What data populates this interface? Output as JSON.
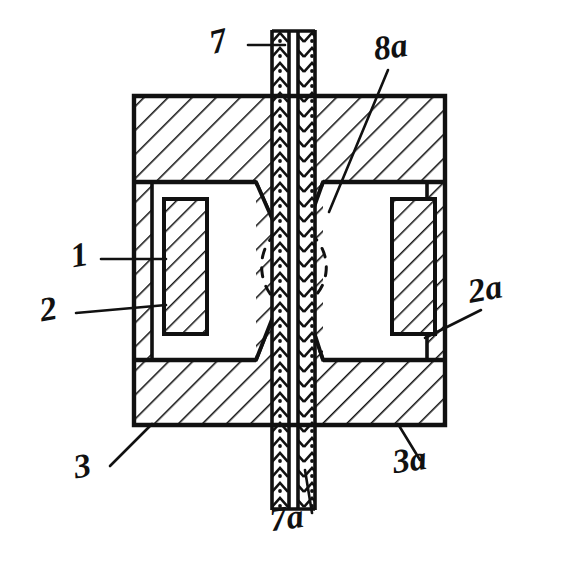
{
  "figure": {
    "style": "line drawing, black ink on white, cross-hatched sections",
    "background_color": "#ffffff",
    "ink_color": "#111111"
  },
  "labels": [
    {
      "id": "label-7",
      "text": "7",
      "x": 221,
      "y": 52,
      "size": 34,
      "rotate": -14,
      "describes": "upper armature shaft / stem"
    },
    {
      "id": "label-8a",
      "text": "8a",
      "x": 392,
      "y": 58,
      "size": 34,
      "rotate": -8,
      "describes": "upper pole face gap region"
    },
    {
      "id": "label-1",
      "text": "1",
      "x": 81,
      "y": 266,
      "size": 34,
      "rotate": -10,
      "describes": "left frame / core leg"
    },
    {
      "id": "label-2",
      "text": "2",
      "x": 50,
      "y": 320,
      "size": 34,
      "rotate": -10,
      "describes": "left coil winding"
    },
    {
      "id": "label-2a",
      "text": "2a",
      "x": 487,
      "y": 300,
      "size": 34,
      "rotate": -10,
      "describes": "right coil winding"
    },
    {
      "id": "label-3",
      "text": "3",
      "x": 84,
      "y": 477,
      "size": 34,
      "rotate": -10,
      "describes": "lower left frame section"
    },
    {
      "id": "label-3a",
      "text": "3a",
      "x": 411,
      "y": 471,
      "size": 34,
      "rotate": -8,
      "describes": "lower right frame section"
    },
    {
      "id": "label-7a",
      "text": "7a",
      "x": 288,
      "y": 529,
      "size": 34,
      "rotate": -8,
      "describes": "lower armature shaft / stem"
    }
  ],
  "leaders": [
    {
      "id": "leader-7",
      "from": [
        248,
        45
      ],
      "to": [
        285,
        45
      ]
    },
    {
      "id": "leader-8a",
      "from": [
        388,
        70
      ],
      "to": [
        329,
        212
      ]
    },
    {
      "id": "leader-1",
      "from": [
        101,
        259
      ],
      "to": [
        166,
        259
      ]
    },
    {
      "id": "leader-2",
      "from": [
        76,
        313
      ],
      "to": [
        166,
        305
      ]
    },
    {
      "id": "leader-2a",
      "from": [
        481,
        310
      ],
      "to": [
        425,
        338
      ]
    },
    {
      "id": "leader-3",
      "from": [
        110,
        466
      ],
      "to": [
        152,
        424
      ]
    },
    {
      "id": "leader-3a",
      "from": [
        420,
        460
      ],
      "to": [
        398,
        424
      ]
    },
    {
      "id": "leader-7a",
      "from": [
        312,
        513
      ],
      "to": [
        305,
        470
      ]
    }
  ],
  "geometry": {
    "frame": {
      "x": 134,
      "y": 96,
      "width": 311,
      "height": 329
    },
    "top_block": {
      "y_top": 96,
      "y_bottom": 182
    },
    "bottom_block": {
      "y_top": 360,
      "y_bottom": 425
    },
    "left_cavity": {
      "x": 152,
      "y": 182,
      "width": 104,
      "height": 178
    },
    "right_cavity": {
      "x": 323,
      "y": 182,
      "width": 104,
      "height": 178
    },
    "left_coil": {
      "x": 164,
      "y": 199,
      "width": 43,
      "height": 135
    },
    "right_coil": {
      "x": 392,
      "y": 199,
      "width": 43,
      "height": 135
    },
    "shaft": {
      "x": 272,
      "y": 30,
      "width": 43,
      "height": 480
    },
    "shaft_core": {
      "x": 288,
      "width": 10
    },
    "gap_ellipse": {
      "cx": 293,
      "cy": 266,
      "rx": 33,
      "ry": 40
    },
    "cone_apex_y": 266
  },
  "hatching": {
    "frame_angle_deg": 45,
    "frame_spacing": 17,
    "coil_angle_deg": 45,
    "coil_spacing": 14,
    "shaft_pattern": "stipple-chevron",
    "shaft_spacing": 15
  }
}
